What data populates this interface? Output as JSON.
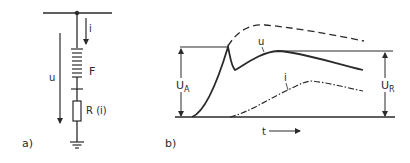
{
  "panel_a": {
    "label": "a)",
    "current_label": "i",
    "voltage_label": "u",
    "arrester_label": "F",
    "resistor_label": "R (i)"
  },
  "panel_b": {
    "label": "b)",
    "time_label": "t",
    "voltage_curve_label": "u",
    "current_curve_label": "i",
    "ua_label": "U",
    "ua_sub": "A",
    "ur_label": "U",
    "ur_sub": "R"
  },
  "colors": {
    "ink": "#2a2a2a",
    "background": "#ffffff"
  }
}
